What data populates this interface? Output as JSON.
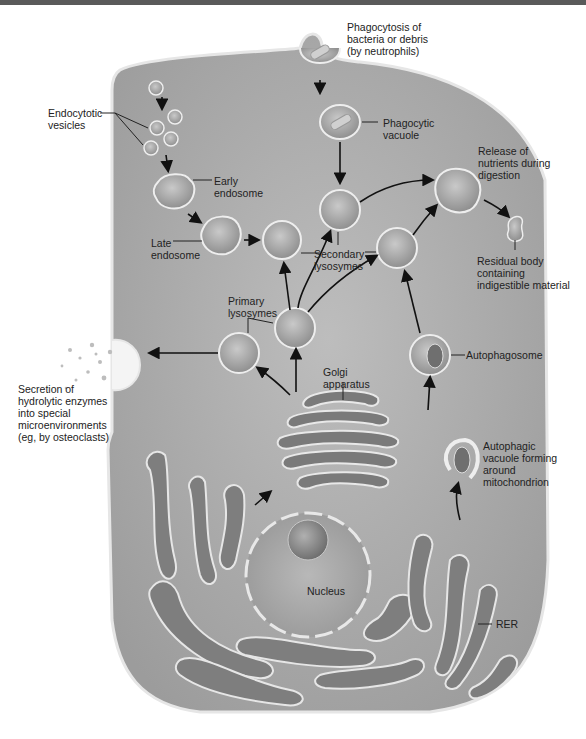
{
  "diagram": {
    "colors": {
      "cytoplasm": "#a6a6a6",
      "membrane": "#e8e8e8",
      "organelle_lumen": "#7d7d7d",
      "text": "#222222",
      "arrow": "#111111"
    },
    "labels": {
      "phagocytosis": "Phagocytosis of\nbacteria or debris\n(by neutrophils)",
      "endocytotic_vesicles": "Endocytotic\nvesicles",
      "phagocytic_vacuole": "Phagocytic\nvacuole",
      "early_endosome": "Early\nendosome",
      "release_nutrients": "Release of\nnutrients during\ndigestion",
      "late_endosome": "Late\nendosome",
      "secondary_lysosomes": "Secondary\nlysosymes",
      "residual_body": "Residual body\ncontaining\nindigestible material",
      "primary_lysosomes": "Primary\nlysosymes",
      "golgi": "Golgi\napparatus",
      "autophagosome": "Autophagosome",
      "secretion": "Secretion of\nhydrolytic enzymes\ninto special\nmicroenvironments\n(eg, by osteoclasts)",
      "autophagic_vacuole": "Autophagic\nvacuole forming\naround\nmitochondrion",
      "nucleus": "Nucleus",
      "rer": "RER"
    }
  }
}
